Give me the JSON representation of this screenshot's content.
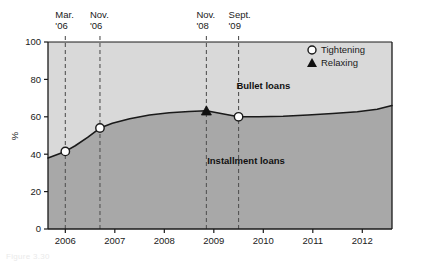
{
  "figure": {
    "caption": "Figure 3.30",
    "colors": {
      "upper_area": "#d9d9d9",
      "lower_area": "#a8a8a8",
      "line": "#1a1a1a",
      "axis": "#1a1a1a",
      "event_line": "#555555",
      "background": "#ffffff"
    }
  },
  "chart_data": {
    "type": "area",
    "title": "",
    "xlabel": "",
    "ylabel": "%",
    "xlim": [
      2005.65,
      2012.6
    ],
    "ylim": [
      0,
      100
    ],
    "grid": false,
    "xticks": [
      2006,
      2007,
      2008,
      2009,
      2010,
      2011,
      2012
    ],
    "xticklabels": [
      "2006",
      "2007",
      "2008",
      "2009",
      "2010",
      "2011",
      "2012"
    ],
    "yticks": [
      0,
      20,
      40,
      60,
      80,
      100
    ],
    "yticklabels": [
      "0",
      "20",
      "40",
      "60",
      "80",
      "100"
    ],
    "series": [
      {
        "name": "Bullet loans",
        "label_position": "above-line",
        "x": [
          2005.65,
          2006.0,
          2006.2,
          2006.45,
          2006.7,
          2006.95,
          2007.3,
          2007.7,
          2008.1,
          2008.5,
          2008.85,
          2009.2,
          2009.5,
          2009.9,
          2010.4,
          2010.9,
          2011.4,
          2011.9,
          2012.3,
          2012.6
        ],
        "y": [
          38.0,
          41.5,
          44.5,
          49.0,
          54.0,
          56.5,
          59.0,
          61.0,
          62.2,
          62.8,
          63.2,
          61.5,
          60.0,
          60.0,
          60.3,
          61.0,
          61.8,
          62.7,
          64.0,
          66.0
        ]
      }
    ],
    "area_labels": [
      {
        "text": "Bullet loans",
        "x": 2010.0,
        "y": 75
      },
      {
        "text": "Installment loans",
        "x": 2009.65,
        "y": 35
      }
    ],
    "markers": [
      {
        "x": 2006.0,
        "y": 41.5,
        "type": "Tightening",
        "shape": "open-circle"
      },
      {
        "x": 2006.7,
        "y": 54.0,
        "type": "Tightening",
        "shape": "open-circle"
      },
      {
        "x": 2008.85,
        "y": 63.2,
        "type": "Relaxing",
        "shape": "filled-triangle"
      },
      {
        "x": 2009.5,
        "y": 60.0,
        "type": "Tightening",
        "shape": "open-circle"
      }
    ],
    "event_lines": [
      {
        "x": 2006.0,
        "label_line1": "Mar.",
        "label_line2": "'06"
      },
      {
        "x": 2006.7,
        "label_line1": "Nov.",
        "label_line2": "'06"
      },
      {
        "x": 2008.85,
        "label_line1": "Nov.",
        "label_line2": "'08"
      },
      {
        "x": 2009.5,
        "label_line1": "Sept.",
        "label_line2": "'09"
      }
    ],
    "legend": {
      "position": "top-right-inside",
      "entries": [
        {
          "label": "Tightening",
          "shape": "open-circle"
        },
        {
          "label": "Relaxing",
          "shape": "filled-triangle"
        }
      ]
    }
  }
}
